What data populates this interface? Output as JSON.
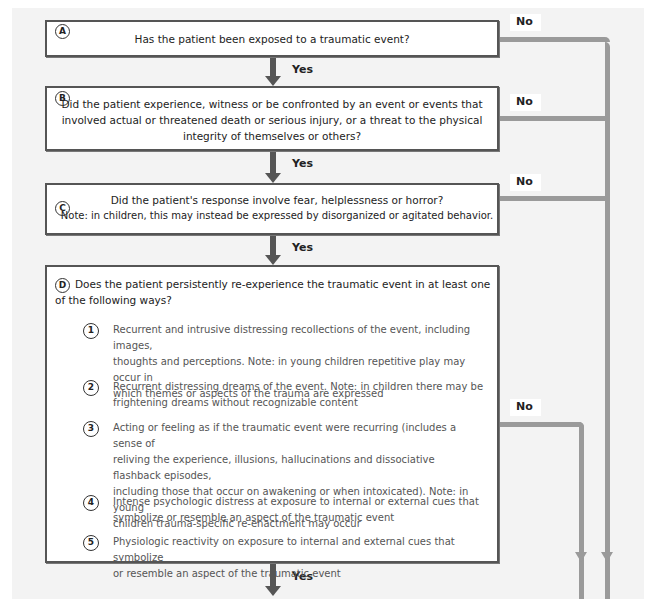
{
  "diagram": {
    "type": "flowchart",
    "colors": {
      "background": "#f3f3f3",
      "box_border": "#555555",
      "yes_arrow": "#555555",
      "no_connector": "#9a9a9a"
    },
    "nodes": [
      {
        "id": "A",
        "badge": "A",
        "text": "Has the patient been exposed to a traumatic event?"
      },
      {
        "id": "B",
        "badge": "B",
        "lines": [
          "Did the patient experience, witness or be confronted by an event or events that",
          "involved actual or threatened death or serious injury, or a threat to the physical",
          "integrity of themselves or others?"
        ]
      },
      {
        "id": "C",
        "badge": "C",
        "lines": [
          "Did the patient's response involve fear, helplessness or horror?",
          "Note: in children, this may instead be expressed by disorganized or agitated behavior."
        ]
      },
      {
        "id": "D",
        "badge": "D",
        "lines": [
          "Does the patient persistently re-experience the traumatic event in at least one",
          "of the following ways?"
        ],
        "items": [
          {
            "badge": "1",
            "lines": [
              "Recurrent and intrusive distressing recollections of the event, including images,",
              "thoughts and perceptions. Note: in young children repetitive play may occur in",
              "which themes or aspects of the trauma are expressed"
            ]
          },
          {
            "badge": "2",
            "lines": [
              "Recurrent distressing dreams of the event. Note: in children there may be",
              "frightening dreams without recognizable content"
            ]
          },
          {
            "badge": "3",
            "lines": [
              "Acting or feeling as if the traumatic event were recurring (includes a sense of",
              "reliving the experience, illusions, hallucinations and dissociative flashback episodes,",
              "including those that occur on awakening or when intoxicated). Note: in young",
              "children trauma-specific re-enactment may occur"
            ]
          },
          {
            "badge": "4",
            "lines": [
              "Intense psychologic distress at exposure to internal or external cues that",
              "symbolize or resemble an aspect of the traumatic event"
            ]
          },
          {
            "badge": "5",
            "lines": [
              "Physiologic reactivity on exposure to internal and external cues that symbolize",
              "or resemble an aspect of the traumatic event"
            ]
          }
        ]
      }
    ],
    "edges": {
      "yes_label": "Yes",
      "no_label": "No",
      "yes": [
        {
          "from": "A",
          "to": "B",
          "label": "Yes"
        },
        {
          "from": "B",
          "to": "C",
          "label": "Yes"
        },
        {
          "from": "C",
          "to": "D",
          "label": "Yes"
        },
        {
          "from": "D",
          "to": "next",
          "label": "Yes"
        }
      ],
      "no": [
        {
          "from": "A",
          "label": "No"
        },
        {
          "from": "B",
          "label": "No"
        },
        {
          "from": "C",
          "label": "No"
        },
        {
          "from": "D",
          "label": "No"
        }
      ]
    }
  }
}
